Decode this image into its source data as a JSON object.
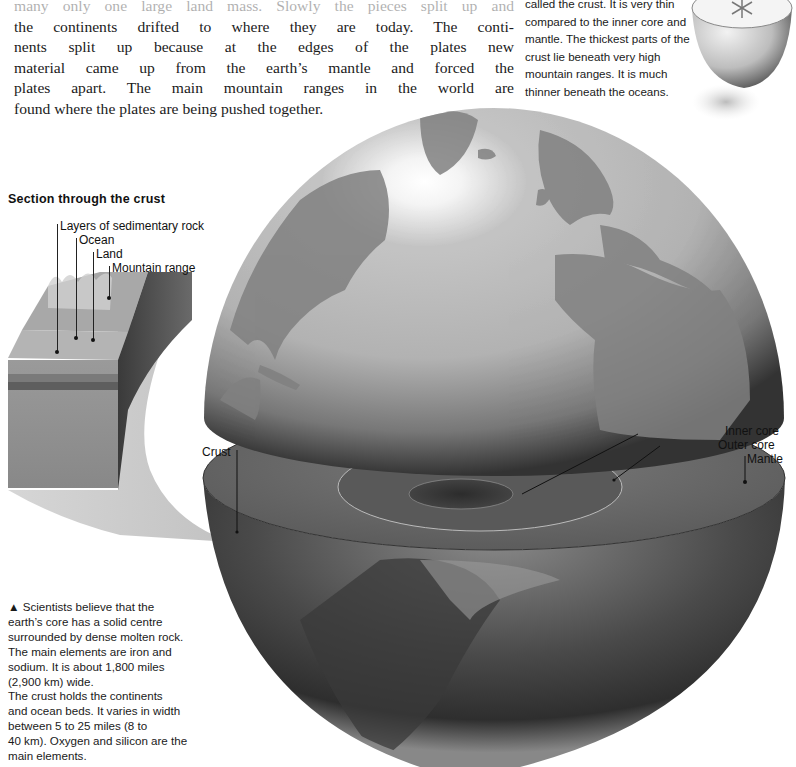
{
  "body_text": {
    "lines": [
      "many only one large land mass. Slowly the pieces split up and",
      "the continents drifted to where they are today. The conti-",
      "nents split up because at the edges of the plates new",
      "material came up from the earth’s mantle and forced the",
      "plates apart. The main mountain ranges in the world are",
      "found where the plates are being pushed together."
    ]
  },
  "crust_text": {
    "lines": [
      "called the crust. It is very thin",
      "compared to the inner core and",
      "mantle. The thickest parts of the",
      "crust lie beneath very high",
      "mountain ranges. It is much",
      "thinner beneath the oceans."
    ]
  },
  "section": {
    "title": "Section through the crust",
    "labels": {
      "sedimentary": "Layers of sedimentary rock",
      "ocean": "Ocean",
      "land": "Land",
      "mountain": "Mountain range"
    }
  },
  "globe_labels": {
    "crust": "Crust",
    "inner_core": "Inner core",
    "outer_core": "Outer core",
    "mantle": "Mantle"
  },
  "caption": {
    "marker": "▲",
    "lines": [
      "Scientists believe that the",
      "earth’s core has a solid centre",
      "surrounded by dense molten rock.",
      "The main elements are iron and",
      "sodium. It is about 1,800 miles",
      "(2,900 km) wide.",
      "The crust holds the continents",
      "and ocean beds. It varies in width",
      "between 5 to 25 miles (8 to",
      "40 km). Oxygen and silicon are the",
      "main elements."
    ]
  },
  "colors": {
    "ocean_light": "#bdbdbd",
    "land_dark": "#7a7a7a",
    "mantle_disc": "#6d6d6d",
    "outer_core": "#5a5a5a",
    "inner_core": "#3a3a3a"
  }
}
